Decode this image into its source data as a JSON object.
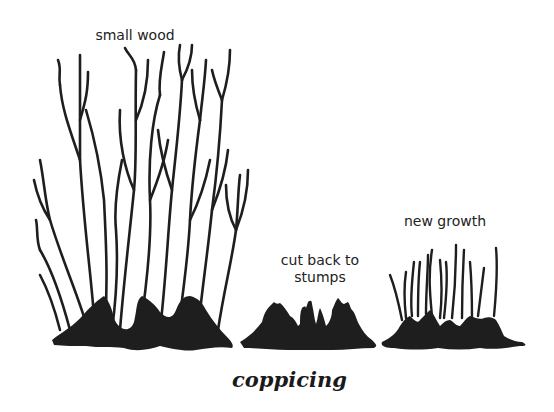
{
  "diagram": {
    "caption": "coppicing",
    "stages": [
      {
        "id": "small-wood",
        "label": "small wood"
      },
      {
        "id": "cut-back",
        "label_line1": "cut back to",
        "label_line2": "stumps"
      },
      {
        "id": "new-growth",
        "label": "new growth"
      }
    ],
    "colors": {
      "ink": "#1e1e1e",
      "background": "#ffffff"
    }
  }
}
